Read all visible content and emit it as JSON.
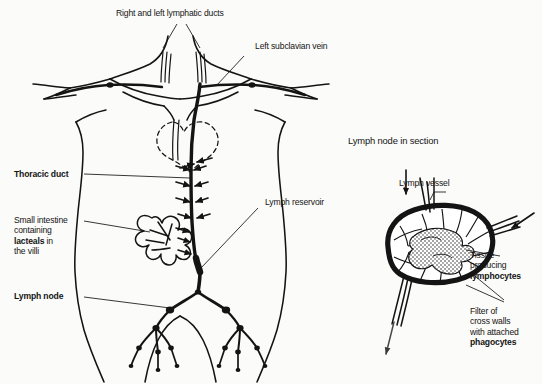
{
  "diagram": {
    "type": "anatomical-illustration",
    "background_color": "#fbfbf9",
    "ink_color": "#141414"
  },
  "labels": {
    "lymphatic_ducts": "Right and left lymphatic ducts",
    "subclavian_vein": "Left subclavian vein",
    "thoracic_duct": "Thoracic duct",
    "small_intestine_line1": "Small intestine",
    "small_intestine_line2": "containing",
    "small_intestine_line3_bold": "lacteals",
    "small_intestine_line3_rest": " in",
    "small_intestine_line4": "the villi",
    "lymph_node": "Lymph node",
    "lymph_reservoir": "Lymph reservoir",
    "node_section_title": "Lymph node in section",
    "lymph_vessel": "Lymph vessel",
    "tissue_line1": "Tissue",
    "tissue_line2": "producing",
    "tissue_line3_bold": "lymphocytes",
    "filter_line1": "Filter of",
    "filter_line2": "cross walls",
    "filter_line3": "with attached",
    "filter_line4_bold": "phagocytes"
  }
}
